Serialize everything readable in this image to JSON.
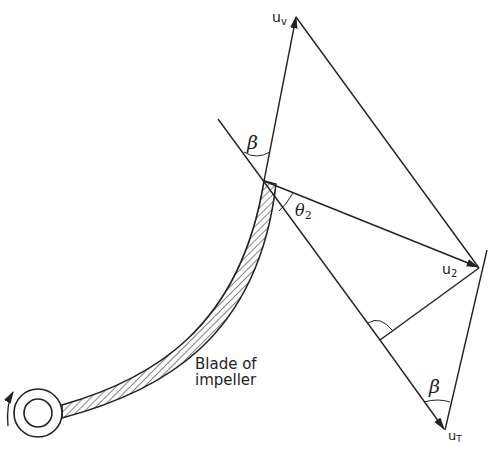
{
  "diagram": {
    "type": "velocity-triangle",
    "labels": {
      "uv": "u",
      "uv_sub": "v",
      "u2": "u",
      "u2_sub": "2",
      "ut": "u",
      "ut_sub": "T",
      "beta_top": "β",
      "beta_bottom": "β",
      "theta2": "θ",
      "theta2_sub": "2",
      "blade_line1": "Blade of",
      "blade_line2": "impeller"
    },
    "colors": {
      "stroke": "#222222",
      "background": "#ffffff"
    }
  }
}
